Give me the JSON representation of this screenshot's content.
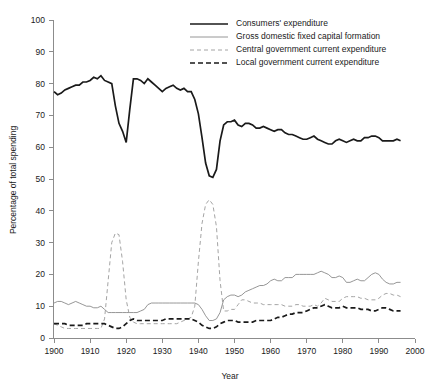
{
  "chart_data": {
    "type": "line",
    "title": "",
    "xlabel": "Year",
    "ylabel": "Percentage of total spending",
    "xlim": [
      1900,
      2000
    ],
    "ylim": [
      0,
      100
    ],
    "xticks": [
      1900,
      1910,
      1920,
      1930,
      1940,
      1950,
      1960,
      1970,
      1980,
      1990,
      2000
    ],
    "yticks": [
      0,
      10,
      20,
      30,
      40,
      50,
      60,
      70,
      80,
      90,
      100
    ],
    "grid": false,
    "legend_position": "top-right",
    "series": [
      {
        "name": "Consumers' expenditure",
        "style": "solid-thick",
        "color": "#1a1a1a",
        "x": [
          1900,
          1901,
          1902,
          1903,
          1904,
          1905,
          1906,
          1907,
          1908,
          1909,
          1910,
          1911,
          1912,
          1913,
          1914,
          1915,
          1916,
          1917,
          1918,
          1919,
          1920,
          1921,
          1922,
          1923,
          1924,
          1925,
          1926,
          1927,
          1928,
          1929,
          1930,
          1931,
          1932,
          1933,
          1934,
          1935,
          1936,
          1937,
          1938,
          1939,
          1940,
          1941,
          1942,
          1943,
          1944,
          1945,
          1946,
          1947,
          1948,
          1949,
          1950,
          1951,
          1952,
          1953,
          1954,
          1955,
          1956,
          1957,
          1958,
          1959,
          1960,
          1961,
          1962,
          1963,
          1964,
          1965,
          1966,
          1967,
          1968,
          1969,
          1970,
          1971,
          1972,
          1973,
          1974,
          1975,
          1976,
          1977,
          1978,
          1979,
          1980,
          1981,
          1982,
          1983,
          1984,
          1985,
          1986,
          1987,
          1988,
          1989,
          1990,
          1991,
          1992,
          1993,
          1994,
          1995,
          1996
        ],
        "y": [
          77.5,
          76.5,
          77.0,
          78.0,
          78.5,
          79.0,
          79.5,
          79.5,
          80.5,
          80.5,
          81.0,
          82.0,
          81.5,
          82.5,
          81.0,
          80.5,
          80.0,
          73.0,
          67.5,
          65.0,
          61.5,
          72.0,
          81.5,
          81.5,
          81.0,
          80.0,
          81.5,
          80.5,
          79.5,
          78.5,
          77.5,
          78.5,
          79.0,
          79.5,
          78.5,
          78.0,
          78.5,
          77.5,
          77.5,
          75.0,
          70.5,
          63.0,
          55.0,
          51.0,
          50.5,
          53.0,
          62.0,
          67.0,
          68.0,
          68.0,
          68.5,
          67.0,
          66.5,
          67.5,
          67.5,
          67.0,
          66.0,
          66.0,
          66.5,
          66.0,
          65.5,
          65.0,
          65.5,
          65.5,
          64.5,
          64.0,
          64.0,
          63.5,
          63.0,
          62.5,
          62.5,
          63.0,
          63.5,
          62.5,
          62.0,
          61.5,
          61.0,
          61.0,
          62.0,
          62.5,
          62.0,
          61.5,
          62.0,
          62.5,
          62.0,
          62.0,
          63.0,
          63.0,
          63.5,
          63.5,
          63.0,
          62.0,
          62.0,
          62.0,
          62.0,
          62.5,
          62.0
        ]
      },
      {
        "name": "Gross domestic fixed capital formation",
        "style": "solid-thin",
        "color": "#8a8a8a",
        "x": [
          1900,
          1901,
          1902,
          1903,
          1904,
          1905,
          1906,
          1907,
          1908,
          1909,
          1910,
          1911,
          1912,
          1913,
          1914,
          1915,
          1916,
          1917,
          1918,
          1919,
          1920,
          1921,
          1922,
          1923,
          1924,
          1925,
          1926,
          1927,
          1928,
          1929,
          1930,
          1931,
          1932,
          1933,
          1934,
          1935,
          1936,
          1937,
          1938,
          1939,
          1940,
          1941,
          1942,
          1943,
          1944,
          1945,
          1946,
          1947,
          1948,
          1949,
          1950,
          1951,
          1952,
          1953,
          1954,
          1955,
          1956,
          1957,
          1958,
          1959,
          1960,
          1961,
          1962,
          1963,
          1964,
          1965,
          1966,
          1967,
          1968,
          1969,
          1970,
          1971,
          1972,
          1973,
          1974,
          1975,
          1976,
          1977,
          1978,
          1979,
          1980,
          1981,
          1982,
          1983,
          1984,
          1985,
          1986,
          1987,
          1988,
          1989,
          1990,
          1991,
          1992,
          1993,
          1994,
          1995,
          1996
        ],
        "y": [
          11.0,
          11.5,
          11.5,
          11.0,
          10.5,
          11.0,
          11.5,
          11.0,
          10.5,
          10.0,
          10.0,
          9.5,
          9.5,
          10.0,
          9.0,
          8.0,
          8.0,
          8.0,
          8.0,
          8.0,
          8.0,
          8.0,
          8.0,
          8.0,
          8.5,
          9.0,
          10.5,
          11.0,
          11.0,
          11.0,
          11.0,
          11.0,
          11.0,
          11.0,
          11.0,
          11.0,
          11.0,
          11.0,
          11.0,
          11.0,
          10.5,
          9.0,
          7.0,
          5.5,
          5.5,
          6.0,
          8.0,
          12.0,
          13.0,
          13.5,
          13.5,
          13.0,
          13.5,
          14.5,
          15.0,
          15.5,
          16.0,
          16.5,
          16.5,
          17.0,
          18.0,
          18.5,
          18.0,
          18.0,
          19.0,
          19.0,
          19.0,
          20.0,
          20.0,
          20.0,
          20.0,
          20.0,
          20.0,
          20.5,
          21.0,
          20.5,
          20.0,
          19.0,
          19.0,
          19.5,
          19.0,
          17.5,
          17.5,
          18.0,
          18.5,
          18.0,
          18.0,
          19.0,
          20.0,
          20.5,
          20.0,
          18.5,
          17.5,
          17.0,
          17.0,
          17.5,
          17.5
        ]
      },
      {
        "name": "Central government current expenditure",
        "style": "dashed-thin",
        "color": "#9a9a9a",
        "x": [
          1900,
          1901,
          1902,
          1903,
          1904,
          1905,
          1906,
          1907,
          1908,
          1909,
          1910,
          1911,
          1912,
          1913,
          1914,
          1915,
          1916,
          1917,
          1918,
          1919,
          1920,
          1921,
          1922,
          1923,
          1924,
          1925,
          1926,
          1927,
          1928,
          1929,
          1930,
          1931,
          1932,
          1933,
          1934,
          1935,
          1936,
          1937,
          1938,
          1939,
          1940,
          1941,
          1942,
          1943,
          1944,
          1945,
          1946,
          1947,
          1948,
          1949,
          1950,
          1951,
          1952,
          1953,
          1954,
          1955,
          1956,
          1957,
          1958,
          1959,
          1960,
          1961,
          1962,
          1963,
          1964,
          1965,
          1966,
          1967,
          1968,
          1969,
          1970,
          1971,
          1972,
          1973,
          1974,
          1975,
          1976,
          1977,
          1978,
          1979,
          1980,
          1981,
          1982,
          1983,
          1984,
          1985,
          1986,
          1987,
          1988,
          1989,
          1990,
          1991,
          1992,
          1993,
          1994,
          1995,
          1996
        ],
        "y": [
          4.5,
          4.0,
          3.5,
          3.0,
          3.0,
          3.0,
          3.0,
          3.0,
          3.0,
          3.0,
          3.0,
          3.0,
          3.0,
          3.0,
          6.0,
          18.0,
          30.0,
          33.0,
          32.5,
          24.0,
          12.0,
          6.5,
          5.0,
          4.5,
          4.5,
          4.5,
          4.5,
          4.5,
          4.5,
          4.5,
          4.5,
          4.5,
          4.5,
          4.5,
          4.5,
          5.0,
          5.5,
          6.0,
          6.5,
          10.0,
          24.0,
          36.0,
          42.0,
          43.5,
          42.0,
          35.0,
          18.0,
          8.5,
          8.5,
          9.0,
          9.0,
          10.5,
          12.0,
          12.0,
          11.5,
          11.0,
          11.0,
          11.0,
          10.5,
          10.5,
          10.5,
          10.5,
          10.5,
          10.5,
          10.0,
          10.0,
          10.0,
          10.5,
          10.5,
          10.0,
          10.0,
          10.0,
          10.5,
          10.0,
          11.0,
          12.5,
          12.0,
          11.5,
          11.5,
          11.5,
          12.5,
          13.0,
          13.0,
          13.0,
          13.0,
          12.5,
          12.5,
          12.0,
          12.0,
          12.0,
          12.5,
          13.5,
          14.0,
          14.0,
          13.5,
          13.5,
          13.0
        ]
      },
      {
        "name": "Local government current expenditure",
        "style": "dashed-thick",
        "color": "#1a1a1a",
        "x": [
          1900,
          1901,
          1902,
          1903,
          1904,
          1905,
          1906,
          1907,
          1908,
          1909,
          1910,
          1911,
          1912,
          1913,
          1914,
          1915,
          1916,
          1917,
          1918,
          1919,
          1920,
          1921,
          1922,
          1923,
          1924,
          1925,
          1926,
          1927,
          1928,
          1929,
          1930,
          1931,
          1932,
          1933,
          1934,
          1935,
          1936,
          1937,
          1938,
          1939,
          1940,
          1941,
          1942,
          1943,
          1944,
          1945,
          1946,
          1947,
          1948,
          1949,
          1950,
          1951,
          1952,
          1953,
          1954,
          1955,
          1956,
          1957,
          1958,
          1959,
          1960,
          1961,
          1962,
          1963,
          1964,
          1965,
          1966,
          1967,
          1968,
          1969,
          1970,
          1971,
          1972,
          1973,
          1974,
          1975,
          1976,
          1977,
          1978,
          1979,
          1980,
          1981,
          1982,
          1983,
          1984,
          1985,
          1986,
          1987,
          1988,
          1989,
          1990,
          1991,
          1992,
          1993,
          1994,
          1995,
          1996
        ],
        "y": [
          4.5,
          4.5,
          4.5,
          4.5,
          4.0,
          4.0,
          4.0,
          4.0,
          4.0,
          4.5,
          4.5,
          4.5,
          4.5,
          4.5,
          4.5,
          4.0,
          3.5,
          3.0,
          3.0,
          3.5,
          4.5,
          5.5,
          6.0,
          5.5,
          5.5,
          5.5,
          5.5,
          5.5,
          5.5,
          5.5,
          5.5,
          6.0,
          6.0,
          6.0,
          6.0,
          6.0,
          6.0,
          6.0,
          6.0,
          5.5,
          5.0,
          4.0,
          3.5,
          3.0,
          3.0,
          3.5,
          4.5,
          5.0,
          5.5,
          5.5,
          5.5,
          5.0,
          5.0,
          5.0,
          5.0,
          5.0,
          5.5,
          5.5,
          5.5,
          5.5,
          5.5,
          6.0,
          6.5,
          6.5,
          7.0,
          7.5,
          7.5,
          8.0,
          8.0,
          8.0,
          8.5,
          9.0,
          9.5,
          9.5,
          10.0,
          10.5,
          10.0,
          9.5,
          9.5,
          9.5,
          10.0,
          9.5,
          9.5,
          9.5,
          9.5,
          9.0,
          9.0,
          9.0,
          8.5,
          8.5,
          9.0,
          9.5,
          9.5,
          9.0,
          8.5,
          8.5,
          8.5
        ]
      }
    ]
  },
  "legend": {
    "items": [
      {
        "label": "Consumers' expenditure"
      },
      {
        "label": "Gross domestic fixed capital formation"
      },
      {
        "label": "Central government current expenditure"
      },
      {
        "label": "Local government current expenditure"
      }
    ]
  },
  "axes": {
    "y_title": "Percentage of total spending",
    "x_title": "Year",
    "y_tick_labels": [
      "0",
      "10",
      "20",
      "30",
      "40",
      "50",
      "60",
      "70",
      "80",
      "90",
      "100"
    ],
    "x_tick_labels": [
      "1900",
      "1910",
      "1920",
      "1930",
      "1940",
      "1950",
      "1960",
      "1970",
      "1980",
      "1990",
      "2000"
    ]
  },
  "colors": {
    "consumers": "#1a1a1a",
    "gdfcf": "#8a8a8a",
    "central": "#9a9a9a",
    "local": "#1a1a1a",
    "axis": "#8c8c8c",
    "background": "#ffffff"
  }
}
